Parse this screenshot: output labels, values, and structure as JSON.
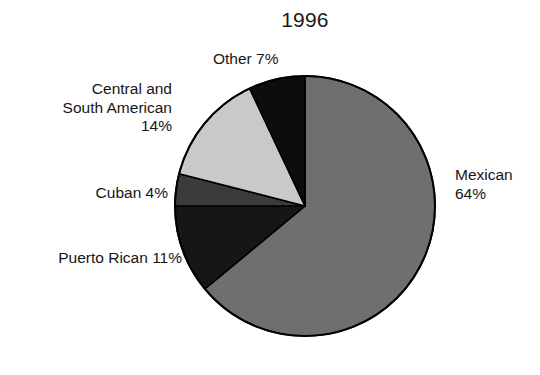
{
  "chart_data": {
    "type": "pie",
    "title": "1996",
    "xlabel": "",
    "ylabel": "",
    "legend_position": "none",
    "grid": false,
    "start_angle_deg": 0,
    "direction": "clockwise",
    "categories": [
      "Mexican",
      "Puerto Rican",
      "Cuban",
      "Central and South American",
      "Other"
    ],
    "values": [
      64,
      11,
      4,
      14,
      7
    ],
    "value_unit": "%",
    "slices": [
      {
        "name": "Mexican",
        "value": 64,
        "label_text": "Mexican\n64%",
        "label_line1": "Mexican",
        "label_line2": "64%",
        "color": "#6f6f6f"
      },
      {
        "name": "Puerto Rican",
        "value": 11,
        "label_text": "Puerto Rican 11%",
        "color": "#161616"
      },
      {
        "name": "Cuban",
        "value": 4,
        "label_text": "Cuban 4%",
        "color": "#3b3b3b"
      },
      {
        "name": "Central and South American",
        "value": 14,
        "label_text": "Central and\nSouth American\n14%",
        "label_line1": "Central and",
        "label_line2": "South American",
        "label_line3": "14%",
        "color": "#c9c9c9"
      },
      {
        "name": "Other",
        "value": 7,
        "label_text": "Other 7%",
        "color": "#0d0d0d"
      }
    ],
    "outline_color": "#000000",
    "background_color": "#ffffff"
  }
}
